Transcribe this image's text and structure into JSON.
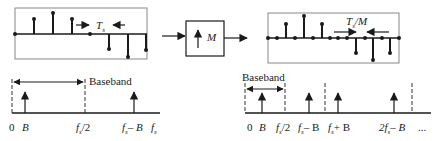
{
  "left_signal": {
    "period_label": "T",
    "period_sub": "s",
    "samples": [
      {
        "x": 15,
        "v": 0
      },
      {
        "x": 34,
        "v": 15
      },
      {
        "x": 53,
        "v": 21
      },
      {
        "x": 72,
        "v": 15
      },
      {
        "x": 90,
        "v": 0
      },
      {
        "x": 109,
        "v": -15
      },
      {
        "x": 128,
        "v": -23
      },
      {
        "x": 146,
        "v": -16
      }
    ]
  },
  "upsampler": {
    "symbol": "↑",
    "factor": "M"
  },
  "right_signal": {
    "period_label": "T",
    "period_sub": "s",
    "period_suffix": "/M",
    "samples": [
      {
        "x": 268,
        "v": 0
      },
      {
        "x": 277,
        "v": 0
      },
      {
        "x": 286,
        "v": 14
      },
      {
        "x": 295,
        "v": 0
      },
      {
        "x": 304,
        "v": 22
      },
      {
        "x": 313,
        "v": 0
      },
      {
        "x": 322,
        "v": 14
      },
      {
        "x": 330,
        "v": 0
      },
      {
        "x": 338,
        "v": 0
      },
      {
        "x": 347,
        "v": 0
      },
      {
        "x": 356,
        "v": -15
      },
      {
        "x": 365,
        "v": 0
      },
      {
        "x": 373,
        "v": -22
      },
      {
        "x": 382,
        "v": 0
      },
      {
        "x": 390,
        "v": -15
      },
      {
        "x": 399,
        "v": 0
      }
    ]
  },
  "left_spectrum": {
    "baseband_label": "Baseband",
    "ticks": [
      {
        "label": "0",
        "italic": false
      },
      {
        "label": "B",
        "italic": true
      },
      {
        "label": "f",
        "sub": "s",
        "suffix": "/2",
        "italic": true
      },
      {
        "label": "f",
        "sub": "s",
        "suffix": "– B",
        "italic": true
      },
      {
        "label": "f",
        "sub": "s",
        "italic": true
      }
    ]
  },
  "right_spectrum": {
    "baseband_label": "Baseband",
    "ticks": [
      {
        "label": "0"
      },
      {
        "label": "B"
      },
      {
        "label": "f",
        "sub": "s",
        "suffix": "/2"
      },
      {
        "label": "f",
        "sub": "s",
        "suffix": "– B"
      },
      {
        "label": "f",
        "sub": "s",
        "suffix": "+ B"
      },
      {
        "label": "2f",
        "sub": "s",
        "suffix": "– B"
      },
      {
        "label": "..."
      }
    ]
  }
}
